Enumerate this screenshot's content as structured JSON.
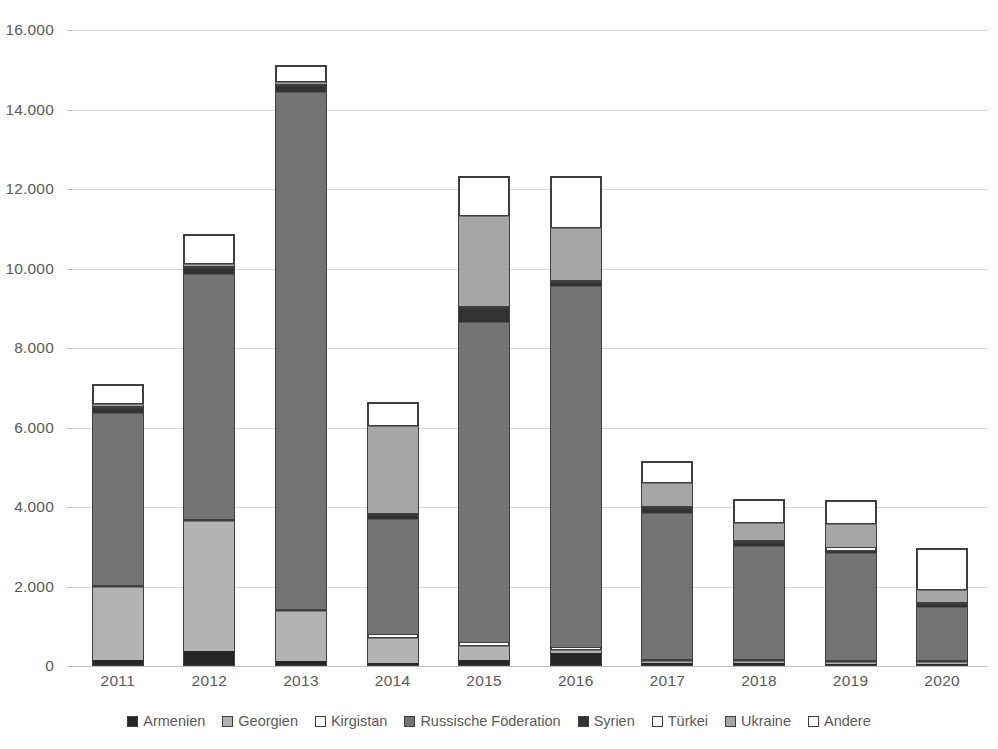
{
  "chart_data": {
    "type": "bar",
    "subtype": "stacked-bar",
    "title": "",
    "xlabel": "",
    "ylabel": "",
    "ylim": [
      0,
      16000
    ],
    "yticks": [
      0,
      2000,
      4000,
      6000,
      8000,
      10000,
      12000,
      14000,
      16000
    ],
    "ytick_labels": [
      "0",
      "2.000",
      "4.000",
      "6.000",
      "8.000",
      "10.000",
      "12.000",
      "14.000",
      "16.000"
    ],
    "grid": true,
    "legend_position": "bottom",
    "categories": [
      "2011",
      "2012",
      "2013",
      "2014",
      "2015",
      "2016",
      "2017",
      "2018",
      "2019",
      "2020"
    ],
    "series": [
      {
        "name": "Armenien",
        "color": "#262626",
        "values": [
          160,
          380,
          130,
          70,
          150,
          340,
          70,
          70,
          40,
          20
        ]
      },
      {
        "name": "Georgien",
        "color": "#b3b3b3",
        "values": [
          1840,
          3270,
          1250,
          640,
          350,
          70,
          20,
          20,
          30,
          20
        ]
      },
      {
        "name": "Kirgistan",
        "color": "#ffffff",
        "values": [
          30,
          30,
          20,
          100,
          100,
          60,
          20,
          20,
          30,
          20
        ]
      },
      {
        "name": "Russische Föderation",
        "color": "#747474",
        "values": [
          4320,
          6170,
          13000,
          2890,
          8050,
          9080,
          3690,
          2840,
          2700,
          1340
        ]
      },
      {
        "name": "Syrien",
        "color": "#333333",
        "values": [
          120,
          150,
          150,
          110,
          350,
          100,
          110,
          110,
          20,
          70
        ]
      },
      {
        "name": "Türkei",
        "color": "#ffffff",
        "values": [
          20,
          20,
          20,
          30,
          20,
          20,
          20,
          20,
          90,
          20
        ]
      },
      {
        "name": "Ukraine",
        "color": "#a6a6a6",
        "values": [
          20,
          20,
          30,
          2190,
          2280,
          1330,
          580,
          420,
          570,
          310
        ]
      },
      {
        "name": "Andere",
        "color": "#ffffff",
        "values": [
          500,
          740,
          450,
          600,
          1000,
          1300,
          560,
          620,
          620,
          1050
        ]
      }
    ],
    "totals": [
      6990,
      10780,
      15050,
      6630,
      12300,
      12300,
      5070,
      4120,
      4100,
      2850
    ]
  },
  "legend": {
    "items": [
      {
        "label": "Armenien",
        "color": "#262626"
      },
      {
        "label": "Georgien",
        "color": "#b3b3b3"
      },
      {
        "label": "Kirgistan",
        "color": "#ffffff"
      },
      {
        "label": "Russische Föderation",
        "color": "#747474"
      },
      {
        "label": "Syrien",
        "color": "#333333"
      },
      {
        "label": "Türkei",
        "color": "#ffffff"
      },
      {
        "label": "Ukraine",
        "color": "#a6a6a6"
      },
      {
        "label": "Andere",
        "color": "#ffffff"
      }
    ]
  }
}
